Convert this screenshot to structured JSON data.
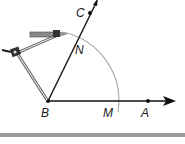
{
  "figure": {
    "points": {
      "B": {
        "label": "B",
        "x": 48,
        "y": 101
      },
      "A": {
        "label": "A",
        "x": 148,
        "y": 101
      },
      "C": {
        "label": "C",
        "x": 90,
        "y": 13
      },
      "M": {
        "label": "M",
        "x": 118,
        "y": 101
      },
      "N": {
        "label": "N",
        "x": 76,
        "y": 44
      }
    },
    "rays": [
      {
        "name": "ray-BA",
        "from": "B",
        "through": "A",
        "arrow": true
      },
      {
        "name": "ray-BC",
        "from": "B",
        "through": "C",
        "arrow": true
      }
    ],
    "arc": {
      "center": "B",
      "radius": 70,
      "from": "M",
      "to": "pencil-tip"
    },
    "tool": "compass",
    "colors": {
      "line": "#111111",
      "arc": "#a8a8a8",
      "compass": "#6b6b6b",
      "bar": "#9a9a9a"
    }
  }
}
